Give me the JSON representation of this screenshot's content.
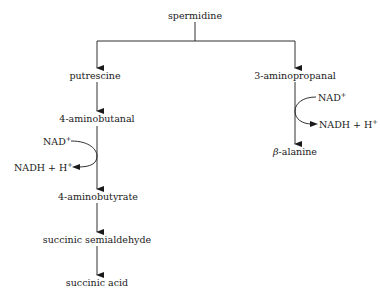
{
  "diagram": {
    "nodes": {
      "spermidine": "spermidine",
      "putrescine": "putrescine",
      "aminopropanal": "3-aminopropanal",
      "aminobutanal": "4-aminobutanal",
      "aminobutyrate": "4-aminobutyrate",
      "succinic_semialdehyde": "succinic semialdehyde",
      "succinic_acid": "succinic acid",
      "beta_alanine_prefix": "β",
      "beta_alanine_rest": "-alanine"
    },
    "cofactors": {
      "left": {
        "in": "NAD",
        "in_sup": "+",
        "out": "NADH + H",
        "out_sup": "+"
      },
      "right": {
        "in": "NAD",
        "in_sup": "+",
        "out": "NADH + H",
        "out_sup": "+"
      }
    },
    "edges": [
      [
        "spermidine",
        "putrescine"
      ],
      [
        "spermidine",
        "3-aminopropanal"
      ],
      [
        "putrescine",
        "4-aminobutanal"
      ],
      [
        "4-aminobutanal",
        "4-aminobutyrate"
      ],
      [
        "4-aminobutyrate",
        "succinic semialdehyde"
      ],
      [
        "succinic semialdehyde",
        "succinic acid"
      ],
      [
        "3-aminopropanal",
        "β-alanine"
      ]
    ]
  }
}
